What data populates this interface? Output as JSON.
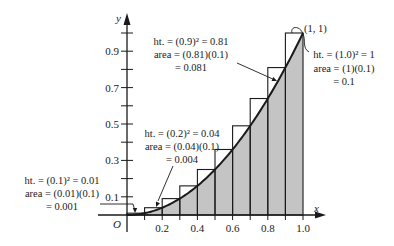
{
  "chart_data": {
    "type": "bar",
    "title": "",
    "xlabel": "x",
    "ylabel": "y",
    "origin_label": "O",
    "xlim": [
      0,
      1.0
    ],
    "ylim": [
      0,
      1.0
    ],
    "grid": false,
    "x_ticks": [
      0.1,
      0.2,
      0.3,
      0.4,
      0.5,
      0.6,
      0.7,
      0.8,
      0.9,
      1.0
    ],
    "x_tick_labels": [
      {
        "x": 0.2,
        "label": "0.2"
      },
      {
        "x": 0.4,
        "label": "0.4"
      },
      {
        "x": 0.6,
        "label": "0.6"
      },
      {
        "x": 0.8,
        "label": "0.8"
      },
      {
        "x": 1.0,
        "label": "1.0"
      }
    ],
    "y_ticks": [
      0.1,
      0.2,
      0.3,
      0.4,
      0.5,
      0.6,
      0.7,
      0.8,
      0.9,
      1.0
    ],
    "y_tick_labels": [
      {
        "y": 0.1,
        "label": "0.1"
      },
      {
        "y": 0.3,
        "label": "0.3"
      },
      {
        "y": 0.5,
        "label": "0.5"
      },
      {
        "y": 0.7,
        "label": "0.7"
      },
      {
        "y": 0.9,
        "label": "0.9"
      }
    ],
    "curve": {
      "function": "y = x^2",
      "x_range": [
        0,
        1
      ]
    },
    "rectangles": {
      "description": "Right-endpoint (circumscribed) rectangles of width 0.1 under y = x^2",
      "width": 0.1,
      "left_edges": [
        0.0,
        0.1,
        0.2,
        0.3,
        0.4,
        0.5,
        0.6,
        0.7,
        0.8,
        0.9
      ],
      "heights": [
        0.01,
        0.04,
        0.09,
        0.16,
        0.25,
        0.36,
        0.49,
        0.64,
        0.81,
        1.0
      ]
    },
    "shaded_region": "area under y = x^2 from 0 to 1",
    "point_label": {
      "x": 1,
      "y": 1,
      "text": "(1, 1)"
    },
    "annotations": [
      {
        "id": "rect1",
        "lines": [
          "ht. = (0.1)² = 0.01",
          "area = (0.01)(0.1)",
          "= 0.001"
        ]
      },
      {
        "id": "rect2",
        "lines": [
          "ht. = (0.2)² = 0.04",
          "area = (0.04)(0.1)",
          "= 0.004"
        ]
      },
      {
        "id": "rect9",
        "lines": [
          "ht. = (0.9)² = 0.81",
          "area = (0.81)(0.1)",
          "= 0.081"
        ]
      },
      {
        "id": "rect10",
        "lines": [
          "ht. = (1.0)² = 1",
          "area = (1)(0.1)",
          "= 0.1"
        ]
      }
    ]
  },
  "colors": {
    "ink": "#1a1a1a",
    "shade": "#c4c4c4",
    "rect_fill": "#ffffff",
    "background": "#ffffff"
  }
}
